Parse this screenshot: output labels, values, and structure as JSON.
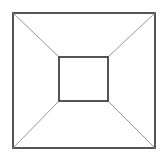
{
  "canvas": {
    "width": 168,
    "height": 160,
    "background_color": "#ffffff"
  },
  "figure": {
    "kind": "line-drawing",
    "text_labels": [],
    "stroke_colors": {
      "outer_rect": "#2b2b2b",
      "inner_rect": "#2b2b2b",
      "diagonals": "#8a8a8a"
    },
    "stroke_widths": {
      "outer_rect": 1.6,
      "inner_rect": 1.6,
      "diagonals": 0.9
    }
  },
  "chart_data": {
    "type": "scatter",
    "title": "",
    "xlabel": "",
    "ylabel": "",
    "xlim": [
      0,
      168
    ],
    "ylim": [
      0,
      160
    ],
    "grid": false,
    "legend": "none",
    "shapes": [
      {
        "name": "outer-rectangle",
        "type": "rect",
        "x": 13,
        "y": 13,
        "width": 142,
        "height": 135,
        "stroke": "#2b2b2b",
        "stroke_width": 1.6,
        "fill": "none",
        "corners": [
          [
            13,
            13
          ],
          [
            155,
            13
          ],
          [
            155,
            148
          ],
          [
            13,
            148
          ]
        ]
      },
      {
        "name": "inner-rectangle",
        "type": "rect",
        "x": 59,
        "y": 57,
        "width": 49,
        "height": 44,
        "stroke": "#2b2b2b",
        "stroke_width": 1.6,
        "fill": "#ffffff",
        "corners": [
          [
            59,
            57
          ],
          [
            108,
            57
          ],
          [
            108,
            101
          ],
          [
            59,
            101
          ]
        ]
      },
      {
        "name": "diagonal-top-left",
        "type": "line",
        "x1": 13,
        "y1": 13,
        "x2": 59,
        "y2": 57,
        "stroke": "#8a8a8a",
        "stroke_width": 0.9
      },
      {
        "name": "diagonal-top-right",
        "type": "line",
        "x1": 155,
        "y1": 13,
        "x2": 108,
        "y2": 57,
        "stroke": "#8a8a8a",
        "stroke_width": 0.9
      },
      {
        "name": "diagonal-bottom-right",
        "type": "line",
        "x1": 155,
        "y1": 148,
        "x2": 108,
        "y2": 101,
        "stroke": "#8a8a8a",
        "stroke_width": 0.9
      },
      {
        "name": "diagonal-bottom-left",
        "type": "line",
        "x1": 13,
        "y1": 148,
        "x2": 59,
        "y2": 101,
        "stroke": "#8a8a8a",
        "stroke_width": 0.9
      }
    ]
  }
}
